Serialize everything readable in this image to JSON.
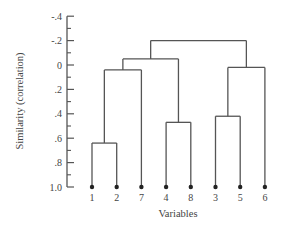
{
  "chart_data": {
    "type": "dendrogram",
    "title": "",
    "xlabel": "Variables",
    "ylabel": "Similarity (correlation)",
    "y_ticks": [
      "-.4",
      "-.2",
      "0",
      ".2",
      ".4",
      ".6",
      ".8",
      "1.0"
    ],
    "y_tick_values": [
      -0.4,
      -0.2,
      0,
      0.2,
      0.4,
      0.6,
      0.8,
      1.0
    ],
    "ylim": [
      -0.4,
      1.0
    ],
    "y_inverted": true,
    "leaves": [
      "1",
      "2",
      "7",
      "4",
      "8",
      "3",
      "5",
      "6"
    ],
    "merges": [
      {
        "members": [
          "1",
          "2"
        ],
        "similarity": 0.64
      },
      {
        "members": [
          "4",
          "8"
        ],
        "similarity": 0.47
      },
      {
        "members": [
          "3",
          "5"
        ],
        "similarity": 0.42
      },
      {
        "members": [
          "1",
          "2",
          "7"
        ],
        "similarity": 0.04
      },
      {
        "members": [
          "3",
          "5",
          "6"
        ],
        "similarity": 0.02
      },
      {
        "members": [
          "1",
          "2",
          "7",
          "4",
          "8"
        ],
        "similarity": -0.05
      },
      {
        "members": [
          "1",
          "2",
          "7",
          "4",
          "8",
          "3",
          "5",
          "6"
        ],
        "similarity": -0.2
      }
    ],
    "grid": false,
    "legend": null
  }
}
